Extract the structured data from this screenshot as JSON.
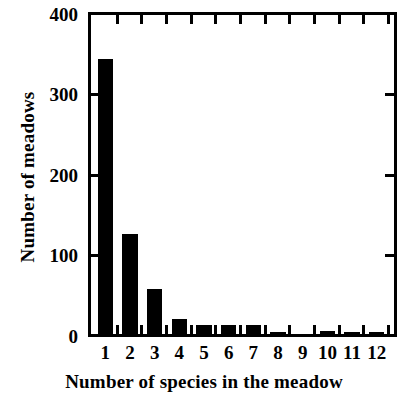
{
  "chart_data": {
    "type": "bar",
    "title": "",
    "xlabel": "Number of species in the meadow",
    "ylabel": "Number of meadows",
    "categories": [
      "1",
      "2",
      "3",
      "4",
      "5",
      "6",
      "7",
      "8",
      "9",
      "10",
      "11",
      "12"
    ],
    "values": [
      345,
      125,
      56,
      19,
      11,
      11,
      11,
      3,
      0,
      4,
      3,
      3
    ],
    "series": [
      {
        "name": "Number of meadows",
        "values": [
          345,
          125,
          56,
          19,
          11,
          11,
          11,
          3,
          0,
          4,
          3,
          3
        ]
      }
    ],
    "ylim": [
      0,
      400
    ],
    "yticks": [
      "0",
      "100",
      "200",
      "300",
      "400"
    ],
    "ytick_values": [
      0,
      100,
      200,
      300,
      400
    ],
    "xlim": [
      0.4,
      12.6
    ],
    "grid": false,
    "legend": "none",
    "bar_color": "#000000",
    "axis_color": "#000000",
    "background": "#ffffff"
  },
  "axes": {
    "y_title": "Number of meadows",
    "x_title": "Number of species in the meadow"
  }
}
